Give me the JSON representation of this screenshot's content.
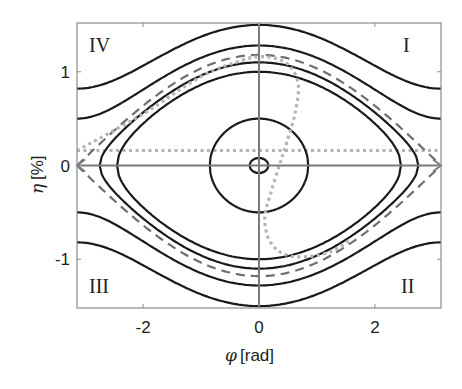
{
  "chart_data": {
    "type": "line",
    "title": "",
    "xlabel": "φ [rad]",
    "xlabel_symbol": "φ",
    "xlabel_unit": "[rad]",
    "ylabel": "η [%]",
    "ylabel_symbol": "η",
    "ylabel_unit": "[%]",
    "xlim": [
      -3.1416,
      3.1416
    ],
    "ylim": [
      -1.52,
      1.52
    ],
    "xticks": [
      -2,
      0,
      2
    ],
    "xtick_labels": [
      "-2",
      "0",
      "2"
    ],
    "yticks": [
      -1,
      0,
      1
    ],
    "ytick_labels": [
      "-1",
      "0",
      "1"
    ],
    "grid": false,
    "legend": null,
    "quadrant_labels": [
      {
        "text": "I",
        "position": "top-right"
      },
      {
        "text": "II",
        "position": "bottom-right"
      },
      {
        "text": "III",
        "position": "bottom-left"
      },
      {
        "text": "IV",
        "position": "top-left"
      }
    ],
    "colors": {
      "solid": "#1a1a1a",
      "separatrix": "#6e6e6e",
      "dotted": "#b3b3b3",
      "axes": "#7a7a7a",
      "frame": "#8c8c8c"
    },
    "series": [
      {
        "name": "open orbit (outer)",
        "style": "solid",
        "kind": "open",
        "eta_at_0": 1.5,
        "eta_at_pi": 0.82
      },
      {
        "name": "open orbit (inner)",
        "style": "solid",
        "kind": "open",
        "eta_at_0": 1.28,
        "eta_at_pi": 0.5
      },
      {
        "name": "separatrix",
        "style": "dashed",
        "kind": "separatrix",
        "eta_at_0": 1.18,
        "eta_at_pi": 0.0
      },
      {
        "name": "closed orbit 1",
        "style": "solid",
        "kind": "closed",
        "eta_at_0": 1.1,
        "phi_max": 2.75
      },
      {
        "name": "closed orbit 2",
        "style": "solid",
        "kind": "closed",
        "eta_at_0": 1.0,
        "phi_max": 2.45
      },
      {
        "name": "closed orbit 3",
        "style": "solid",
        "kind": "closed",
        "eta_at_0": 0.5,
        "phi_max": 0.85
      },
      {
        "name": "fixed point ring",
        "style": "solid",
        "kind": "closed",
        "eta_at_0": 0.08,
        "phi_max": 0.16
      }
    ],
    "dotted_horizontal_line": {
      "eta": 0.16,
      "style": "dotted"
    },
    "dotted_curve": {
      "style": "dotted",
      "points": [
        [
          -3.14,
          0.16
        ],
        [
          -2.0,
          0.55
        ],
        [
          -1.0,
          0.95
        ],
        [
          -0.3,
          1.12
        ],
        [
          0.0,
          1.16
        ],
        [
          0.3,
          1.14
        ],
        [
          0.55,
          1.05
        ],
        [
          0.68,
          0.85
        ],
        [
          0.62,
          0.55
        ],
        [
          0.48,
          0.25
        ],
        [
          0.35,
          0.0
        ],
        [
          0.2,
          -0.3
        ],
        [
          0.1,
          -0.55
        ],
        [
          0.18,
          -0.8
        ],
        [
          0.45,
          -0.95
        ],
        [
          0.9,
          -0.97
        ],
        [
          1.3,
          -0.9
        ],
        [
          1.6,
          -0.78
        ]
      ]
    },
    "axes_arrows": {
      "x_axis_arrow_ends": [
        "left",
        "right"
      ],
      "through_origin": true
    }
  }
}
